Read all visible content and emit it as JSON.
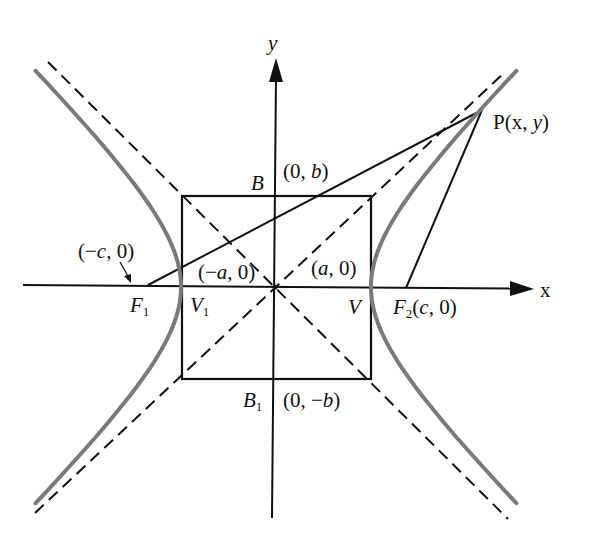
{
  "diagram": {
    "colors": {
      "curve": "#7a7a7a",
      "lines": "#111111",
      "background": "#ffffff"
    },
    "axes": {
      "x_label": "x",
      "y_label": "y"
    },
    "labels": {
      "B": "B",
      "b_top": {
        "pre": "(0, ",
        "var": "b",
        "post": ")"
      },
      "neg_c": {
        "pre": "(−",
        "var": "c",
        "post": ", 0)"
      },
      "neg_a": {
        "pre": "(−",
        "var": "a",
        "post": ", 0)"
      },
      "pos_a": {
        "pre": "(",
        "var": "a",
        "post": ", 0)"
      },
      "F1": {
        "name": "F",
        "sub": "1"
      },
      "V1": {
        "name": "V",
        "sub": "1"
      },
      "V": "V",
      "F2": {
        "name": "F",
        "sub": "2",
        "pre": "(",
        "var": "c",
        "post": ", 0)"
      },
      "B1": {
        "name": "B",
        "sub": "1"
      },
      "b_bottom": {
        "pre": "(0, −",
        "var": "b",
        "post": ")"
      },
      "P": {
        "pre": "P(x, ",
        "var": "y",
        "post": ")"
      }
    }
  }
}
